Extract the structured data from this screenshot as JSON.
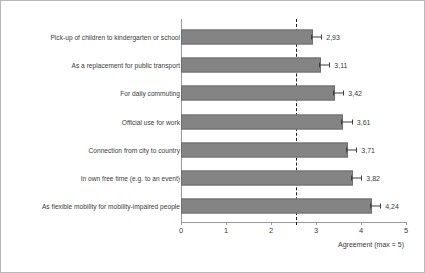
{
  "chart_data": {
    "type": "bar",
    "orientation": "horizontal",
    "title": "",
    "xlabel": "Agreement (max = 5)",
    "ylabel": "",
    "xlim": [
      0,
      5
    ],
    "xticks": [
      "0",
      "1",
      "2",
      "3",
      "4",
      "5"
    ],
    "grid": false,
    "legend": false,
    "reference_line": {
      "value": 2.55,
      "style": "dashed",
      "color": "#1a1a1a"
    },
    "categories": [
      "Pick-up of children to kindergarten or school",
      "As a replacement for public transport",
      "For daily commuting",
      "Official use for work",
      "Connection from city to country",
      "In own free time (e.g. to an event)",
      "As flexible mobility for mobility-impaired people"
    ],
    "values": [
      2.93,
      3.11,
      3.42,
      3.61,
      3.71,
      3.82,
      4.24
    ],
    "value_labels": [
      "2,93",
      "3,11",
      "3,42",
      "3,61",
      "3,71",
      "3,82",
      "4,24"
    ],
    "error_bars": [
      0.12,
      0.12,
      0.12,
      0.12,
      0.12,
      0.12,
      0.12
    ],
    "bar_color": "#848484",
    "bar_edge_color": "#6e6e6e",
    "axis_color": "#9a9a9a",
    "text_color": "#3a3a3a"
  }
}
